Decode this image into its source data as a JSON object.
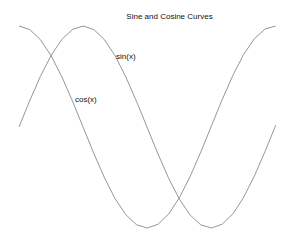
{
  "chart_data": {
    "type": "line",
    "title": "Sine and Cosine Curves",
    "xlabel": "",
    "ylabel": "",
    "grid": false,
    "axes_visible": false,
    "legend": "none (inline text labels)",
    "x_range": [
      0,
      7.07
    ],
    "ylim": [
      -1,
      1
    ],
    "series": [
      {
        "name": "sin(x)",
        "label_position": [
          120,
          56
        ],
        "x": [
          0,
          0.785,
          1.571,
          2.356,
          3.142,
          3.927,
          4.712,
          5.498,
          6.283,
          7.069
        ],
        "values": [
          0,
          0.707,
          1,
          0.707,
          0,
          -0.707,
          -1,
          -0.707,
          0,
          0.707
        ]
      },
      {
        "name": "cos(x)",
        "label_position": [
          76,
          99
        ],
        "x": [
          0,
          0.785,
          1.571,
          2.356,
          3.142,
          3.927,
          4.712,
          5.498,
          6.283,
          7.069
        ],
        "values": [
          1,
          0.707,
          0,
          -0.707,
          -1,
          -0.707,
          0,
          0.707,
          1,
          0.707
        ]
      }
    ],
    "annotations": [
      "sin(x)",
      "cos(x)"
    ]
  },
  "plot": {
    "px_x0": 19,
    "px_per_rad": 40.74,
    "px_y_center": 127,
    "px_amplitude": 101,
    "x_end": 6.3
  }
}
